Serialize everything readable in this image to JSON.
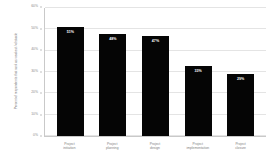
{
  "chart_data": {
    "type": "bar",
    "title": "",
    "xlabel": "",
    "ylabel": "Percent of respondents that rank as weakest / obstacle",
    "categories": [
      "Project initiation",
      "Project planning",
      "Project design",
      "Project implementation",
      "Project closure"
    ],
    "category_lines": [
      [
        "Project",
        "initiation"
      ],
      [
        "Project",
        "planning"
      ],
      [
        "Project",
        "design"
      ],
      [
        "Project",
        "implementation"
      ],
      [
        "Project",
        "closure"
      ]
    ],
    "values": [
      51,
      48,
      47,
      33,
      29
    ],
    "value_labels": [
      "51%",
      "48%",
      "47%",
      "33%",
      "29%"
    ],
    "ylim": [
      0,
      60
    ],
    "yticks": [
      0,
      10,
      20,
      30,
      40,
      50,
      60
    ],
    "ytick_labels": [
      "0%",
      "10%",
      "20%",
      "30%",
      "40%",
      "50%",
      "60%"
    ],
    "grid": true,
    "legend": false,
    "bar_color": "#050505",
    "label_color": "#ffffff",
    "axis_color": "#c9c9c9",
    "grid_color": "#e4e4e4",
    "text_color": "#7d7d7d",
    "background": "#ffffff"
  }
}
